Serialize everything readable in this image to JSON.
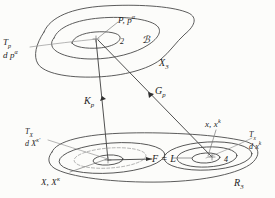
{
  "figure": {
    "kind": "hand-drawn-mathematical-diagram",
    "ink_color": "#3d3d3d",
    "background_color": "#fcfcfa"
  },
  "upper_region": {
    "name": "X3",
    "boundary_label": "X",
    "boundary_label_sub": "3",
    "point_label": "P, p",
    "point_label_sup": "α",
    "inner_marker": "2",
    "set_symbol": "ℬ",
    "tangent_label_top": "T",
    "tangent_label_top_sub": "p",
    "tangent_label_bottom": "d p",
    "tangent_label_bottom_sup": "α"
  },
  "lower_region": {
    "name": "R3",
    "boundary_label": "R",
    "boundary_label_sub": "3",
    "left_point_label": "X, X",
    "left_point_label_sup": "κ",
    "right_point_label": "x, x",
    "right_point_label_sup": "k",
    "left_tangent_top": "T",
    "left_tangent_top_sub": "X",
    "left_tangent_bottom": "d X",
    "left_tangent_bottom_sup": "κ'",
    "right_tangent_top": "T",
    "right_tangent_top_sub": "x",
    "right_tangent_bottom": "d x",
    "right_tangent_bottom_sup": "k",
    "connector_label": "F = L",
    "right_inner_marker": "4"
  },
  "mappings": [
    {
      "id": "map-kp",
      "label": "K",
      "label_sub": "p",
      "from": "upper_region_point",
      "to": "lower_region_left_point"
    },
    {
      "id": "map-gp",
      "label": "G",
      "label_sub": "p",
      "from": "upper_region_point",
      "to": "lower_region_right_point"
    }
  ]
}
